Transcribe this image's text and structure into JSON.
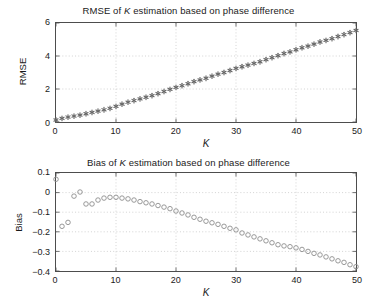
{
  "figure": {
    "background": "#ffffff",
    "axis_color": "#4d4d4d",
    "grid_color": "#bfbfbf",
    "marker_color": "#808080"
  },
  "chart_data": [
    {
      "id": "rmse",
      "type": "scatter",
      "title_prefix": "RMSE of ",
      "title_italic": "K",
      "title_suffix": " estimation based on phase difference",
      "title": "RMSE of K estimation based on phase difference",
      "xlabel": "K",
      "ylabel": "RMSE",
      "xlim": [
        0,
        50
      ],
      "ylim": [
        0,
        6
      ],
      "xticks": [
        0,
        10,
        20,
        30,
        40,
        50
      ],
      "xticklabels": [
        "0",
        "10",
        "20",
        "30",
        "40",
        "50"
      ],
      "yticks": [
        0,
        2,
        4,
        6
      ],
      "yticklabels": [
        "0",
        "2",
        "4",
        "6"
      ],
      "grid": true,
      "legend": null,
      "marker": "asterisk",
      "marker_color": "#666666",
      "x": [
        0,
        1,
        2,
        3,
        4,
        5,
        6,
        7,
        8,
        9,
        10,
        11,
        12,
        13,
        14,
        15,
        16,
        17,
        18,
        19,
        20,
        21,
        22,
        23,
        24,
        25,
        26,
        27,
        28,
        29,
        30,
        31,
        32,
        33,
        34,
        35,
        36,
        37,
        38,
        39,
        40,
        41,
        42,
        43,
        44,
        45,
        46,
        47,
        48,
        49,
        50
      ],
      "values": [
        0.12,
        0.22,
        0.3,
        0.36,
        0.42,
        0.5,
        0.58,
        0.66,
        0.74,
        0.83,
        0.95,
        1.08,
        1.2,
        1.3,
        1.4,
        1.5,
        1.6,
        1.72,
        1.85,
        1.98,
        2.1,
        2.2,
        2.32,
        2.45,
        2.55,
        2.65,
        2.78,
        2.9,
        3.0,
        3.12,
        3.25,
        3.35,
        3.45,
        3.55,
        3.65,
        3.78,
        3.9,
        4.02,
        4.15,
        4.25,
        4.38,
        4.5,
        4.6,
        4.72,
        4.85,
        4.95,
        5.05,
        5.18,
        5.3,
        5.42,
        5.55
      ]
    },
    {
      "id": "bias",
      "type": "scatter",
      "title_prefix": "Bias of ",
      "title_italic": "K",
      "title_suffix": " estimation based on phase difference",
      "title": "Bias of K estimation based on phase difference",
      "xlabel": "K",
      "ylabel": "Bias",
      "xlim": [
        0,
        50
      ],
      "ylim": [
        -0.4,
        0.1
      ],
      "xticks": [
        0,
        10,
        20,
        30,
        40,
        50
      ],
      "xticklabels": [
        "0",
        "10",
        "20",
        "30",
        "40",
        "50"
      ],
      "yticks": [
        0.1,
        0,
        -0.1,
        -0.2,
        -0.3,
        -0.4
      ],
      "yticklabels": [
        "0.1",
        "0",
        "−0.1",
        "−0.2",
        "−0.3",
        "−0.4"
      ],
      "grid": true,
      "legend": null,
      "marker": "circle",
      "marker_color": "#8c8c8c",
      "x": [
        0,
        1,
        2,
        3,
        4,
        5,
        6,
        7,
        8,
        9,
        10,
        11,
        12,
        13,
        14,
        15,
        16,
        17,
        18,
        19,
        20,
        21,
        22,
        23,
        24,
        25,
        26,
        27,
        28,
        29,
        30,
        31,
        32,
        33,
        34,
        35,
        36,
        37,
        38,
        39,
        40,
        41,
        42,
        43,
        44,
        45,
        46,
        47,
        48,
        49,
        50
      ],
      "values": [
        0.068,
        -0.172,
        -0.152,
        -0.018,
        0.003,
        -0.058,
        -0.058,
        -0.038,
        -0.028,
        -0.024,
        -0.024,
        -0.028,
        -0.032,
        -0.038,
        -0.046,
        -0.052,
        -0.058,
        -0.066,
        -0.074,
        -0.082,
        -0.094,
        -0.104,
        -0.114,
        -0.126,
        -0.136,
        -0.146,
        -0.154,
        -0.162,
        -0.172,
        -0.182,
        -0.19,
        -0.206,
        -0.216,
        -0.226,
        -0.236,
        -0.246,
        -0.256,
        -0.266,
        -0.272,
        -0.276,
        -0.282,
        -0.29,
        -0.3,
        -0.31,
        -0.318,
        -0.328,
        -0.338,
        -0.348,
        -0.356,
        -0.368,
        -0.378
      ]
    }
  ]
}
